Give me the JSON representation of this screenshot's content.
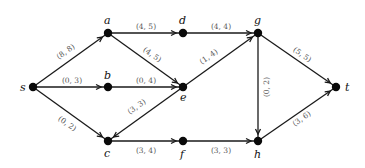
{
  "graph": {
    "type": "directed flow network",
    "nodes": [
      {
        "id": "s",
        "label": "s",
        "x": 33,
        "y": 87,
        "lx": 20,
        "ly": 91
      },
      {
        "id": "a",
        "label": "a",
        "x": 108,
        "y": 33,
        "lx": 104,
        "ly": 24
      },
      {
        "id": "b",
        "label": "b",
        "x": 108,
        "y": 87,
        "lx": 104,
        "ly": 79
      },
      {
        "id": "c",
        "label": "c",
        "x": 108,
        "y": 141,
        "lx": 104,
        "ly": 157
      },
      {
        "id": "d",
        "label": "d",
        "x": 183,
        "y": 33,
        "lx": 179,
        "ly": 24
      },
      {
        "id": "e",
        "label": "e",
        "x": 183,
        "y": 87,
        "lx": 180,
        "ly": 101
      },
      {
        "id": "f",
        "label": "f",
        "x": 183,
        "y": 141,
        "lx": 180,
        "ly": 158
      },
      {
        "id": "g",
        "label": "g",
        "x": 258,
        "y": 33,
        "lx": 254,
        "ly": 24
      },
      {
        "id": "h",
        "label": "h",
        "x": 258,
        "y": 141,
        "lx": 254,
        "ly": 158
      },
      {
        "id": "t",
        "label": "t",
        "x": 336,
        "y": 87,
        "lx": 345,
        "ly": 91
      }
    ],
    "edges": [
      {
        "from": "s",
        "to": "a",
        "label": "(8, 8)",
        "lx": 66,
        "ly": 52,
        "rot": -35
      },
      {
        "from": "s",
        "to": "b",
        "label": "(0, 3)",
        "lx": 72,
        "ly": 81,
        "rot": 0
      },
      {
        "from": "s",
        "to": "c",
        "label": "(0, 2)",
        "lx": 67,
        "ly": 124,
        "rot": 35
      },
      {
        "from": "a",
        "to": "d",
        "label": "(4, 5)",
        "lx": 146,
        "ly": 27,
        "rot": 0
      },
      {
        "from": "a",
        "to": "e",
        "label": "(4, 5)",
        "lx": 152,
        "ly": 55,
        "rot": 35
      },
      {
        "from": "b",
        "to": "e",
        "label": "(0, 4)",
        "lx": 146,
        "ly": 81,
        "rot": 0
      },
      {
        "from": "e",
        "to": "c",
        "label": "(3, 3)",
        "lx": 137,
        "ly": 107,
        "rot": -35
      },
      {
        "from": "d",
        "to": "g",
        "label": "(4, 4)",
        "lx": 221,
        "ly": 27,
        "rot": 0
      },
      {
        "from": "e",
        "to": "g",
        "label": "(1, 4)",
        "lx": 209,
        "ly": 57,
        "rot": -35
      },
      {
        "from": "c",
        "to": "f",
        "label": "(3, 4)",
        "lx": 146,
        "ly": 151,
        "rot": 0
      },
      {
        "from": "f",
        "to": "h",
        "label": "(3, 3)",
        "lx": 221,
        "ly": 151,
        "rot": 0
      },
      {
        "from": "g",
        "to": "h",
        "label": "(0, 2)",
        "lx": 267,
        "ly": 87,
        "rot": -90
      },
      {
        "from": "g",
        "to": "t",
        "label": "(5, 5)",
        "lx": 302,
        "ly": 55,
        "rot": 35
      },
      {
        "from": "h",
        "to": "t",
        "label": "(3, 6)",
        "lx": 302,
        "ly": 119,
        "rot": -35
      }
    ]
  }
}
